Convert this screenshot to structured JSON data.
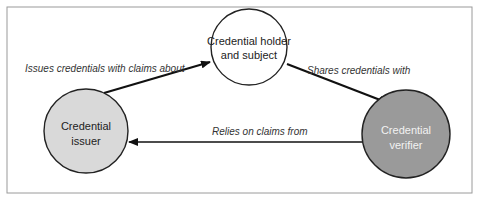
{
  "diagram": {
    "nodes": [
      {
        "id": "holder",
        "line1": "Credential holder",
        "line2": "and subject",
        "fill": "#ffffff",
        "text_color": "#222222"
      },
      {
        "id": "issuer",
        "line1": "Credential",
        "line2": "issuer",
        "fill": "#d9d9d9",
        "text_color": "#333333"
      },
      {
        "id": "verifier",
        "line1": "Credential",
        "line2": "verifier",
        "fill": "#9a9a9a",
        "text_color": "#f2f2f2"
      }
    ],
    "edges": [
      {
        "from": "issuer",
        "to": "holder",
        "label": "Issues credentials with claims about"
      },
      {
        "from": "holder",
        "to": "verifier",
        "label": "Shares credentials with"
      },
      {
        "from": "verifier",
        "to": "issuer",
        "label": "Relies on claims from"
      }
    ]
  }
}
